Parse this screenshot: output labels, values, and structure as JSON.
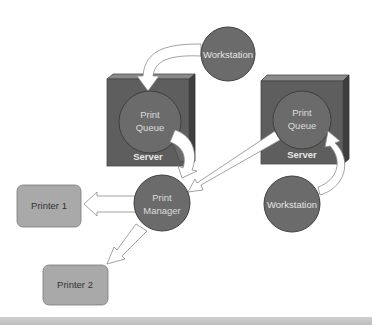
{
  "diagram": {
    "colors": {
      "node_fill": "#6b6b6b",
      "node_stroke": "#4a4a4a",
      "server_front": "#5e5e5e",
      "server_top": "#808080",
      "server_side": "#3e3e3e",
      "printer_fill": "#a9a9a9",
      "printer_stroke": "#7a7a7a",
      "arrow_fill": "#ffffff",
      "arrow_stroke": "#8a8a8a",
      "node_text": "#e6e6e6",
      "printer_text": "#333333",
      "background": "#ffffff",
      "footer_bar": "#c4c4c4"
    },
    "nodes": {
      "workstation_top": {
        "label": "Workstation"
      },
      "server_left": {
        "label": "Server",
        "queue_line1": "Print",
        "queue_line2": "Queue"
      },
      "server_right": {
        "label": "Server",
        "queue_line1": "Print",
        "queue_line2": "Queue"
      },
      "workstation_right": {
        "label": "Workstation"
      },
      "print_manager": {
        "line1": "Print",
        "line2": "Manager"
      },
      "printer_1": {
        "label": "Printer 1"
      },
      "printer_2": {
        "label": "Printer 2"
      }
    },
    "edges": [
      {
        "from": "workstation_top",
        "to": "server_left.print_queue"
      },
      {
        "from": "server_left.print_queue",
        "to": "print_manager"
      },
      {
        "from": "server_right.print_queue",
        "to": "print_manager"
      },
      {
        "from": "workstation_right",
        "to": "server_right.print_queue"
      },
      {
        "from": "print_manager",
        "to": "printer_1"
      },
      {
        "from": "print_manager",
        "to": "printer_2"
      }
    ]
  }
}
